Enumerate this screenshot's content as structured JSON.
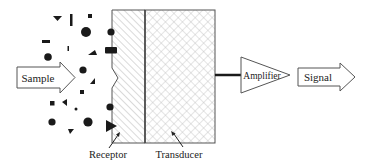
{
  "diagram": {
    "labels": {
      "sample": "Sample",
      "receptor": "Receptor",
      "transducer": "Transducer",
      "amplifier": "Amplifier",
      "signal": "Signal"
    },
    "colors": {
      "stroke": "#555555",
      "fill_dark": "#1a1a1a",
      "hatch": "#b5b5b5",
      "background": "#ffffff"
    },
    "analytes": [
      {
        "shape": "triangle-down",
        "x": 57,
        "y": 18
      },
      {
        "shape": "bar-vertical",
        "x": 71,
        "y": 20
      },
      {
        "shape": "square",
        "x": 90,
        "y": 16
      },
      {
        "shape": "circle-large",
        "x": 86,
        "y": 32
      },
      {
        "shape": "bar-horizontal",
        "x": 46,
        "y": 42
      },
      {
        "shape": "tick",
        "x": 68,
        "y": 48
      },
      {
        "shape": "triangle-up",
        "x": 92,
        "y": 53
      },
      {
        "shape": "circle",
        "x": 48,
        "y": 57
      },
      {
        "shape": "circle",
        "x": 83,
        "y": 70
      },
      {
        "shape": "triangle",
        "x": 92,
        "y": 81
      },
      {
        "shape": "square",
        "x": 82,
        "y": 92
      },
      {
        "shape": "square",
        "x": 52,
        "y": 103
      },
      {
        "shape": "triangle-left",
        "x": 65,
        "y": 102
      },
      {
        "shape": "dot",
        "x": 76,
        "y": 109
      },
      {
        "shape": "circle",
        "x": 52,
        "y": 122
      },
      {
        "shape": "circle-large",
        "x": 88,
        "y": 122
      },
      {
        "shape": "triangle-down",
        "x": 71,
        "y": 131
      }
    ],
    "bound_analytes": [
      {
        "shape": "circle",
        "x": 111,
        "y": 32
      },
      {
        "shape": "rectangle",
        "x": 111,
        "y": 50
      },
      {
        "shape": "circle",
        "x": 110,
        "y": 107
      },
      {
        "shape": "triangle-right",
        "x": 111,
        "y": 126
      }
    ]
  }
}
